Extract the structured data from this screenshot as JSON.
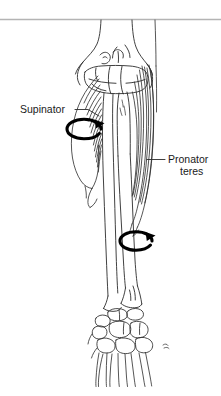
{
  "figure": {
    "background_color": "#ffffff",
    "ink_color": "#2b2b2b",
    "rule_color": "#b4b4b4"
  },
  "labels": {
    "supinator": {
      "text": "Supinator",
      "line1": "Supinator"
    },
    "pronator_teres": {
      "text": "Pronator teres",
      "line1": "Pronator",
      "line2": "teres"
    }
  },
  "arrows": {
    "supinator_rotation": {
      "name": "supination-rotation-arrow",
      "direction": "clockwise",
      "color": "#000000"
    },
    "pronator_rotation": {
      "name": "pronation-rotation-arrow",
      "direction": "clockwise",
      "color": "#000000"
    }
  },
  "structures": {
    "humerus": "humerus",
    "trochlea": "trochlea",
    "capitulum": "capitulum",
    "radius": "radius",
    "ulna": "ulna",
    "olecranon": "olecranon",
    "supinator_muscle": "supinator muscle",
    "pronator_teres_muscle": "pronator teres muscle",
    "carpals": "carpal bones",
    "metacarpals": "metacarpal bones"
  }
}
